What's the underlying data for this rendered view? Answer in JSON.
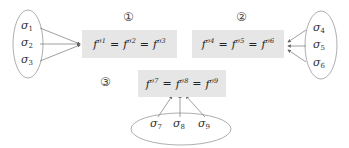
{
  "groups": [
    {
      "label": "①",
      "equation": {
        "f": "f",
        "parts": [
          "σ1",
          "σ2",
          "σ3"
        ],
        "sup": [
          "σ",
          "σ",
          "σ"
        ],
        "subs": [
          "1",
          "2",
          "3"
        ],
        "eq": "="
      },
      "elements": [
        {
          "sym": "σ",
          "sub": "1"
        },
        {
          "sym": "σ",
          "sub": "2"
        },
        {
          "sym": "σ",
          "sub": "3"
        }
      ]
    },
    {
      "label": "②",
      "equation": {
        "f": "f",
        "parts": [
          "σ4",
          "σ5",
          "σ6"
        ],
        "sup": [
          "σ",
          "σ",
          "σ"
        ],
        "subs": [
          "4",
          "5",
          "6"
        ],
        "eq": "="
      },
      "elements": [
        {
          "sym": "σ",
          "sub": "4"
        },
        {
          "sym": "σ",
          "sub": "5"
        },
        {
          "sym": "σ",
          "sub": "6"
        }
      ]
    },
    {
      "label": "③",
      "equation": {
        "f": "f",
        "parts": [
          "σ7",
          "σ8",
          "σ9"
        ],
        "sup": [
          "σ",
          "σ",
          "σ"
        ],
        "subs": [
          "7",
          "8",
          "9"
        ],
        "eq": "="
      },
      "elements": [
        {
          "sym": "σ",
          "sub": "7"
        },
        {
          "sym": "σ",
          "sub": "8"
        },
        {
          "sym": "σ",
          "sub": "9"
        }
      ]
    }
  ],
  "colors": {
    "box_bg": "#e6e6e6",
    "line": "#777777",
    "ellipse": "#999999"
  }
}
